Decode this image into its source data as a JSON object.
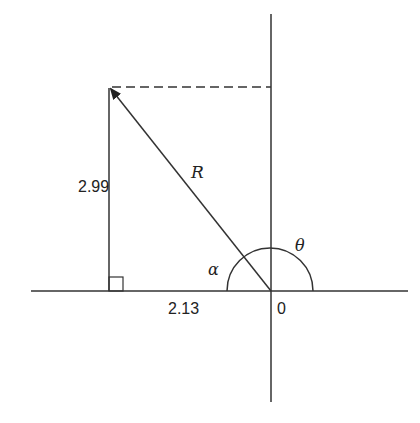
{
  "diagram": {
    "labels": {
      "opposite_side": "2.99",
      "adjacent_side": "2.13",
      "hypotenuse": "R",
      "alpha": "α",
      "theta": "θ",
      "origin": "0"
    },
    "stroke_color": "#333333",
    "background": "#ffffff"
  }
}
